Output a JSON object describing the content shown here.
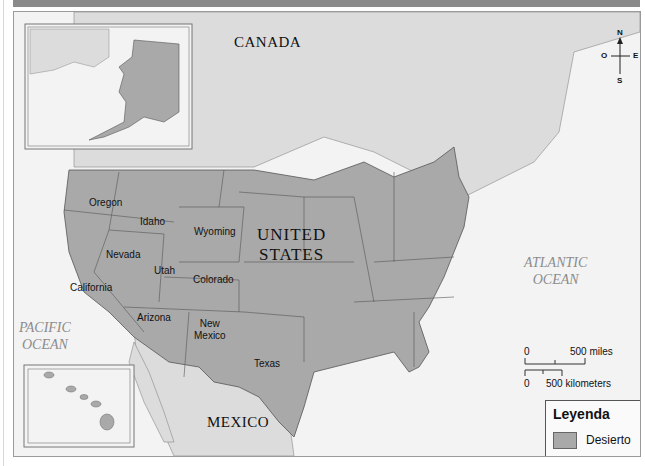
{
  "map": {
    "countries": [
      "CANADA",
      "UNITED STATES",
      "MEXICO"
    ],
    "us_label_line1": "UNITED",
    "us_label_line2": "STATES",
    "canada": "CANADA",
    "mexico": "MEXICO",
    "oceans": {
      "pacific_line1": "PACIFIC",
      "pacific_line2": "OCEAN",
      "atlantic_line1": "ATLANTIC",
      "atlantic_line2": "OCEAN"
    },
    "states": {
      "oregon": "Oregon",
      "idaho": "Idaho",
      "wyoming": "Wyoming",
      "nevada": "Nevada",
      "utah": "Utah",
      "colorado": "Colorado",
      "california": "California",
      "arizona": "Arizona",
      "new_mexico_line1": "New",
      "new_mexico_line2": "Mexico",
      "texas": "Texas"
    },
    "insets": [
      "Alaska",
      "Hawaii"
    ]
  },
  "compass": {
    "north": "N",
    "south": "S",
    "east": "E",
    "west": "O"
  },
  "scale": {
    "miles_zero": "0",
    "miles_label": "500 miles",
    "km_zero": "0",
    "km_label": "500 kilometers"
  },
  "legend": {
    "title": "Leyenda",
    "items": [
      {
        "label": "Desierto",
        "color": "#a9a9a9"
      }
    ]
  },
  "colors": {
    "us_fill": "#a9a9a9",
    "land_fill": "#dcdcdc",
    "water_fill": "#f3f3f3",
    "border": "#555555"
  }
}
